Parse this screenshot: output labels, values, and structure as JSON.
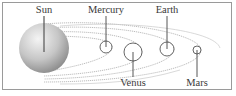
{
  "colors": {
    "frame": "#9a9a9a",
    "orbit": "#9c9c9c",
    "planet_stroke": "#555555",
    "leader": "#444444",
    "sun_light": "#f2f2f2",
    "sun_mid": "#c4c4c4",
    "sun_dark": "#8a8a8a",
    "label": "#3a3a3a"
  },
  "bodies": [
    {
      "id": "sun",
      "label": "Sun",
      "cx": 44,
      "cy": 48,
      "r": 25,
      "label_pos": "top"
    },
    {
      "id": "mercury",
      "label": "Mercury",
      "cx": 106,
      "cy": 47,
      "r": 6,
      "label_pos": "top"
    },
    {
      "id": "venus",
      "label": "Venus",
      "cx": 133,
      "cy": 52,
      "r": 9,
      "label_pos": "bottom"
    },
    {
      "id": "earth",
      "label": "Earth",
      "cx": 167,
      "cy": 49,
      "r": 7,
      "label_pos": "top"
    },
    {
      "id": "mars",
      "label": "Mars",
      "cx": 197,
      "cy": 50,
      "r": 4,
      "label_pos": "bottom"
    }
  ]
}
